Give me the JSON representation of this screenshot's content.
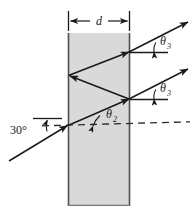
{
  "figure": {
    "type": "optics-ray-diagram",
    "width": 196,
    "height": 212,
    "background_color": "#ffffff",
    "slab": {
      "name": "transparent slab",
      "fill_color": "#d9d9d9",
      "edge_color": "#555555",
      "left_x": 68,
      "right_x": 130,
      "top_y": 33,
      "bottom_y": 206
    },
    "labels": {
      "thickness": "d",
      "incident_angle": "30°",
      "refraction_angle": "θ",
      "refraction_angle_sub": "2",
      "exit_angle_upper": "θ",
      "exit_angle_upper_sub": "3",
      "exit_angle_lower": "θ",
      "exit_angle_lower_sub": "3"
    },
    "line_color": "#1a1a1a",
    "dashed_color": "#2a2a2a"
  }
}
